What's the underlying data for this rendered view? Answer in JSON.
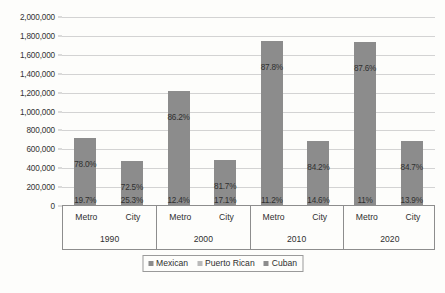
{
  "chart_data": {
    "type": "bar",
    "title": "",
    "subtitle": "",
    "xlabel": "",
    "ylabel": "",
    "ylim": [
      0,
      2000000
    ],
    "y_tick_step": 200000,
    "grid": true,
    "legend_position": "bottom",
    "y_ticks": [
      "0",
      "200,000",
      "400,000",
      "600,000",
      "800,000",
      "1,000,000",
      "1,200,000",
      "1,400,000",
      "1,600,000",
      "1,800,000",
      "2,000,000"
    ],
    "y_tick_values": [
      0,
      200000,
      400000,
      600000,
      800000,
      1000000,
      1200000,
      1400000,
      1600000,
      1800000,
      2000000
    ],
    "group_labels": [
      "1990",
      "2000",
      "2010",
      "2020"
    ],
    "sub_labels": [
      "Metro",
      "City"
    ],
    "categories": [
      "1990 Metro",
      "1990 City",
      "2000 Metro",
      "2000 City",
      "2010 Metro",
      "2010 City",
      "2020 Metro",
      "2020 City"
    ],
    "values": [
      720000,
      480000,
      1215000,
      490000,
      1745000,
      690000,
      1740000,
      690000
    ],
    "series": [
      {
        "name": "Mexican",
        "color": "#8c8c8c",
        "values": [
          720000,
          480000,
          1215000,
          490000,
          1745000,
          690000,
          1740000,
          690000
        ]
      }
    ],
    "legend": [
      {
        "label": "Mexican",
        "color": "#8c8c8c"
      },
      {
        "label": "Puerto Rican",
        "color": "#b9b9b9"
      },
      {
        "label": "Cuban",
        "color": "#8c8c8c"
      }
    ],
    "annotations": [
      {
        "category": "1990 Metro",
        "upper": "78.0%",
        "lower": "19.7%"
      },
      {
        "category": "1990 City",
        "upper": "72.5%",
        "lower": "25.3%"
      },
      {
        "category": "2000 Metro",
        "upper": "86.2%",
        "lower": "12.4%"
      },
      {
        "category": "2000 City",
        "upper": "81.7%",
        "lower": "17.1%"
      },
      {
        "category": "2010 Metro",
        "upper": "87.8%",
        "lower": "11.2%"
      },
      {
        "category": "2010 City",
        "upper": "84.2%",
        "lower": "14.6%"
      },
      {
        "category": "2020 Metro",
        "upper": "87.6%",
        "lower": "11%"
      },
      {
        "category": "2020 City",
        "upper": "84.7%",
        "lower": "13.9%"
      }
    ]
  }
}
